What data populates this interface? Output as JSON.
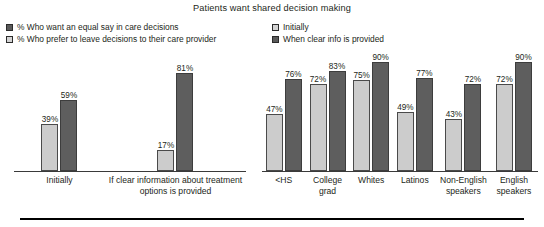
{
  "chart_data": {
    "type": "bar",
    "title": "Patients want shared decision making",
    "xlabel": "",
    "ylabel": "",
    "ylim": [
      0,
      95
    ],
    "grid": false,
    "panels": [
      {
        "name": "overall",
        "legend_position": "top-left",
        "legend": [
          {
            "label": "% Who want an equal say in care decisions",
            "swatch": "dark"
          },
          {
            "label": "% Who prefer to leave decisions to their care provider",
            "swatch": "light"
          }
        ],
        "categories": [
          "Initially",
          "If clear information about treatment options is provided"
        ],
        "series": [
          {
            "name": "% Who prefer to leave decisions to their care provider",
            "swatch": "light",
            "values": [
              39,
              17
            ],
            "labels": [
              "39%",
              "17%"
            ]
          },
          {
            "name": "% Who want an equal say in care decisions",
            "swatch": "dark",
            "values": [
              59,
              81
            ],
            "labels": [
              "59%",
              "81%"
            ]
          }
        ]
      },
      {
        "name": "by-subgroup",
        "legend_position": "top-center",
        "legend": [
          {
            "label": "Initially",
            "swatch": "light"
          },
          {
            "label": "When clear info is provided",
            "swatch": "dark"
          }
        ],
        "categories": [
          "<HS",
          "College grad",
          "Whites",
          "Latinos",
          "Non-English speakers",
          "English speakers"
        ],
        "series": [
          {
            "name": "Initially",
            "swatch": "light",
            "values": [
              47,
              72,
              75,
              49,
              43,
              72
            ],
            "labels": [
              "47%",
              "72%",
              "75%",
              "49%",
              "43%",
              "72%"
            ]
          },
          {
            "name": "When clear info is provided",
            "swatch": "dark",
            "values": [
              76,
              83,
              90,
              77,
              72,
              90
            ],
            "labels": [
              "76%",
              "83%",
              "90%",
              "77%",
              "72%",
              "90%"
            ]
          }
        ]
      }
    ]
  },
  "colors": {
    "light_bar": "#cccccc",
    "dark_bar": "#5e5e5e",
    "text": "#231f20",
    "axis": "#3a3a3a",
    "rule": "#000000"
  }
}
